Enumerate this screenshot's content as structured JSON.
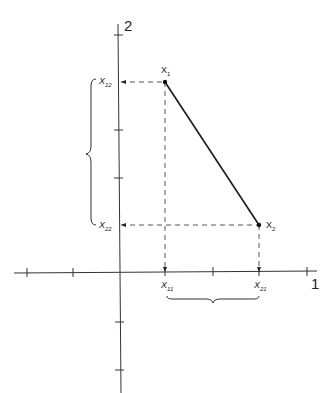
{
  "diagram": {
    "title": "",
    "axes": {
      "horizontal_label": "1",
      "vertical_label": "2"
    },
    "points": [
      {
        "name": "X",
        "sub": "1",
        "x": 165,
        "y": 82
      },
      {
        "name": "X",
        "sub": "2",
        "x": 259,
        "y": 225
      }
    ],
    "projections": {
      "x11": {
        "name": "X",
        "sub": "11"
      },
      "x21": {
        "name": "X",
        "sub": "21"
      },
      "x12": {
        "name": "X",
        "sub": "12"
      },
      "x22": {
        "name": "X",
        "sub": "22"
      }
    },
    "colors": {
      "line": "#1a1a1a",
      "dashed": "#555555"
    }
  }
}
